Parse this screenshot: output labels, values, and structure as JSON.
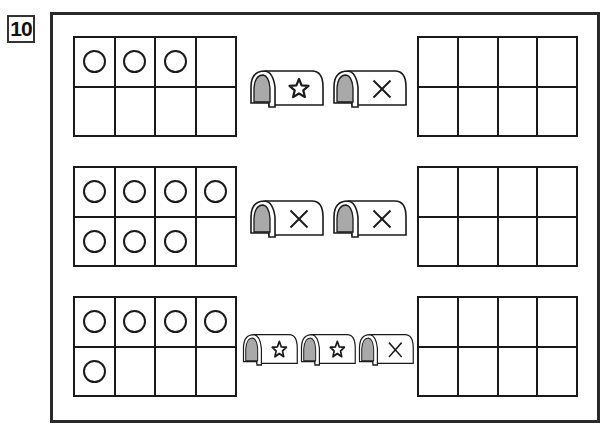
{
  "problem_number": "10",
  "colors": {
    "line": "#1a1a1a",
    "tunnel_shade": "#a9a9a9",
    "background": "#ffffff"
  },
  "rows": [
    {
      "input_grid": {
        "rows": 2,
        "cols": 4,
        "filled": [
          true,
          true,
          true,
          false,
          false,
          false,
          false,
          false
        ],
        "count": 3
      },
      "tunnels": [
        {
          "symbol": "star",
          "icon": "star-icon"
        },
        {
          "symbol": "cross",
          "icon": "cross-icon"
        }
      ],
      "answer_grid": {
        "rows": 2,
        "cols": 4,
        "filled": [
          false,
          false,
          false,
          false,
          false,
          false,
          false,
          false
        ]
      }
    },
    {
      "input_grid": {
        "rows": 2,
        "cols": 4,
        "filled": [
          true,
          true,
          true,
          true,
          true,
          true,
          true,
          false
        ],
        "count": 7
      },
      "tunnels": [
        {
          "symbol": "cross",
          "icon": "cross-icon"
        },
        {
          "symbol": "cross",
          "icon": "cross-icon"
        }
      ],
      "answer_grid": {
        "rows": 2,
        "cols": 4,
        "filled": [
          false,
          false,
          false,
          false,
          false,
          false,
          false,
          false
        ]
      }
    },
    {
      "input_grid": {
        "rows": 2,
        "cols": 4,
        "filled": [
          true,
          true,
          true,
          true,
          true,
          false,
          false,
          false
        ],
        "count": 5
      },
      "tunnels": [
        {
          "symbol": "star",
          "icon": "star-icon"
        },
        {
          "symbol": "star",
          "icon": "star-icon"
        },
        {
          "symbol": "cross",
          "icon": "cross-icon"
        }
      ],
      "answer_grid": {
        "rows": 2,
        "cols": 4,
        "filled": [
          false,
          false,
          false,
          false,
          false,
          false,
          false,
          false
        ]
      }
    }
  ]
}
